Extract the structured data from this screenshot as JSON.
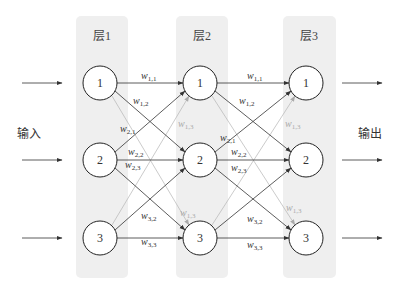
{
  "layers": [
    {
      "label": "层1",
      "x": 76,
      "center_x": 100
    },
    {
      "label": "层2",
      "x": 176,
      "center_x": 200
    },
    {
      "label": "层3",
      "x": 283,
      "center_x": 306
    }
  ],
  "node_rows_y": [
    83,
    160,
    238
  ],
  "node_labels": [
    "1",
    "2",
    "3"
  ],
  "input_label": "输入",
  "output_label": "输出",
  "weights": {
    "w11": {
      "base": "w",
      "sub": "1,1"
    },
    "w12": {
      "base": "w",
      "sub": "1,2"
    },
    "w13": {
      "base": "w",
      "sub": "1,3"
    },
    "w21": {
      "base": "w",
      "sub": "2,1"
    },
    "w22": {
      "base": "w",
      "sub": "2,2"
    },
    "w23": {
      "base": "w",
      "sub": "2,3"
    },
    "w31": {
      "base": "w",
      "sub": "3,1"
    },
    "w32": {
      "base": "w",
      "sub": "3,2"
    },
    "w33": {
      "base": "w",
      "sub": "3,3"
    }
  },
  "colors": {
    "layer_bg": "#efefef",
    "strong_edge": "#333333",
    "light_edge": "#b5b5b5",
    "node_fill": "#ffffff",
    "node_stroke": "#222222"
  }
}
